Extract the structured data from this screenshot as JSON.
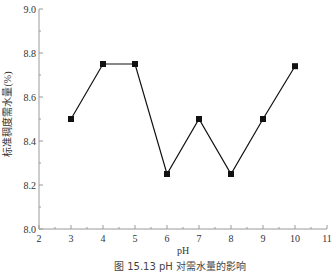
{
  "chart_data": {
    "type": "line",
    "title": "",
    "caption": "图 15.13   pH 对需水量的影响",
    "xlabel": "pH",
    "ylabel": "标准稠度需水量(%)",
    "xlim": [
      2,
      11
    ],
    "ylim": [
      8.0,
      9.0
    ],
    "xticks": [
      2,
      3,
      4,
      5,
      6,
      7,
      8,
      9,
      10,
      11
    ],
    "xtick_labels": [
      "2",
      "3",
      "4",
      "5",
      "6",
      "7",
      "8",
      "9",
      "10",
      "11"
    ],
    "yticks": [
      8.0,
      8.2,
      8.4,
      8.6,
      8.8,
      9.0
    ],
    "ytick_labels": [
      "8.0",
      "8.2",
      "8.4",
      "8.6",
      "8.8",
      "9.0"
    ],
    "grid": false,
    "legend": "none",
    "series": [
      {
        "name": "标准稠度需水量",
        "marker": "square",
        "color": "#111111",
        "x": [
          3,
          4,
          5,
          6,
          7,
          8,
          9,
          10
        ],
        "y": [
          8.5,
          8.75,
          8.75,
          8.25,
          8.5,
          8.25,
          8.5,
          8.74
        ]
      }
    ]
  }
}
